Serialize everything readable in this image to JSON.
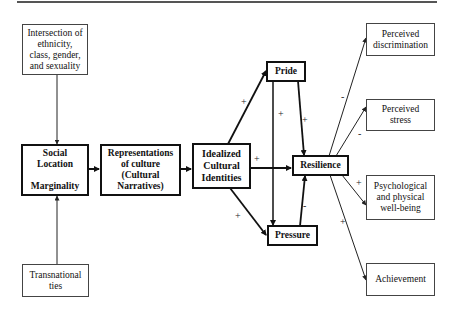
{
  "diagram": {
    "nodes": {
      "intersection": {
        "label": "Intersection of\nethnicity,\nclass, gender,\nand sexuality"
      },
      "social_location": {
        "label": "Social\nLocation\n\nMarginality"
      },
      "representations": {
        "label": "Representations\nof culture\n(Cultural\nNarratives)"
      },
      "idealized": {
        "label": "Idealized\nCultural\nIdentities"
      },
      "pride": {
        "label": "Pride"
      },
      "pressure": {
        "label": "Pressure"
      },
      "resilience": {
        "label": "Resilience"
      },
      "transnational": {
        "label": "Transnational\nties"
      },
      "perceived_discrimination": {
        "label": "Perceived\ndiscrimination"
      },
      "perceived_stress": {
        "label": "Perceived\nstress"
      },
      "wellbeing": {
        "label": "Psychological\nand physical\nwell-being"
      },
      "achievement": {
        "label": "Achievement"
      }
    },
    "edges": [
      {
        "from": "intersection",
        "to": "social_location",
        "sign": ""
      },
      {
        "from": "transnational",
        "to": "social_location",
        "sign": ""
      },
      {
        "from": "social_location",
        "to": "representations",
        "sign": ""
      },
      {
        "from": "representations",
        "to": "idealized",
        "sign": ""
      },
      {
        "from": "idealized",
        "to": "pride",
        "sign": "+"
      },
      {
        "from": "idealized",
        "to": "resilience",
        "sign": "+"
      },
      {
        "from": "idealized",
        "to": "pressure",
        "sign": "+"
      },
      {
        "from": "pride",
        "to": "pressure",
        "sign": "+"
      },
      {
        "from": "pride",
        "to": "resilience",
        "sign": "+"
      },
      {
        "from": "pressure",
        "to": "resilience",
        "sign": "-"
      },
      {
        "from": "resilience",
        "to": "perceived_discrimination",
        "sign": "-"
      },
      {
        "from": "resilience",
        "to": "perceived_stress",
        "sign": "-"
      },
      {
        "from": "resilience",
        "to": "wellbeing",
        "sign": "+"
      },
      {
        "from": "resilience",
        "to": "achievement",
        "sign": "+"
      }
    ],
    "signs": {
      "idealized_pride": "+",
      "pride_pressure": "+",
      "pride_resilience": "+",
      "idealized_resilience": "+",
      "idealized_pressure": "+",
      "pressure_resilience": "-",
      "resilience_discrimination": "-",
      "resilience_stress": "-",
      "resilience_wellbeing": "+",
      "resilience_achievement": "+"
    }
  }
}
